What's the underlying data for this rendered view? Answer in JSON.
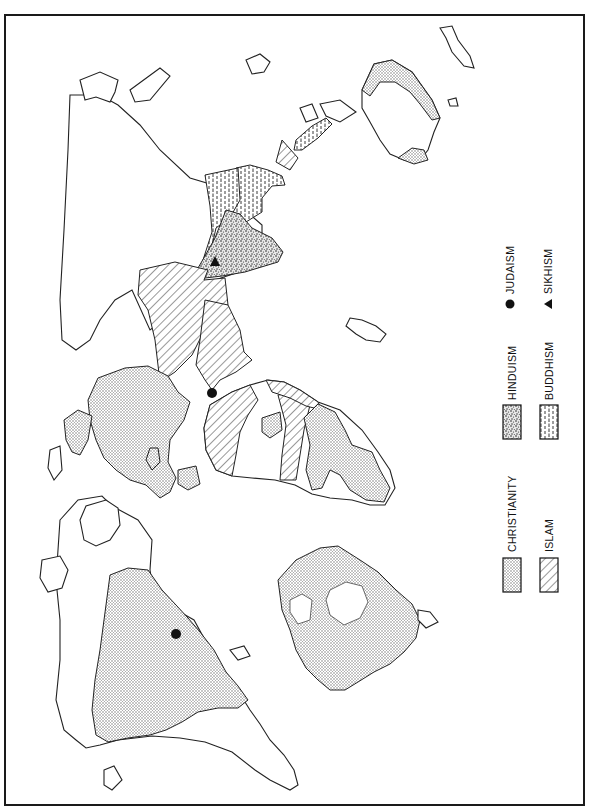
{
  "map": {
    "orientation": "rotated 90 degrees clockwise",
    "subject": "World distribution of major religions"
  },
  "legend": {
    "items": [
      {
        "id": "christianity",
        "label": "CHRISTIANITY",
        "symbol": "dotted-fill"
      },
      {
        "id": "islam",
        "label": "ISLAM",
        "symbol": "diagonal-hatch"
      },
      {
        "id": "hinduism",
        "label": "HINDUISM",
        "symbol": "coarse-stipple"
      },
      {
        "id": "buddhism",
        "label": "BUDDHISM",
        "symbol": "dash-hatch"
      },
      {
        "id": "judaism",
        "label": "JUDAISM",
        "symbol": "filled-circle"
      },
      {
        "id": "sikhism",
        "label": "SIKHISM",
        "symbol": "filled-triangle"
      }
    ]
  },
  "markers": [
    {
      "type": "judaism",
      "location": "Israel",
      "x": 212,
      "y": 393
    },
    {
      "type": "judaism",
      "location": "New York",
      "x": 176,
      "y": 634
    },
    {
      "type": "sikhism",
      "location": "Punjab",
      "x": 215,
      "y": 262
    }
  ],
  "colors": {
    "ink": "#222222",
    "background": "#ffffff",
    "dot_fill": "#b8b8b8"
  }
}
